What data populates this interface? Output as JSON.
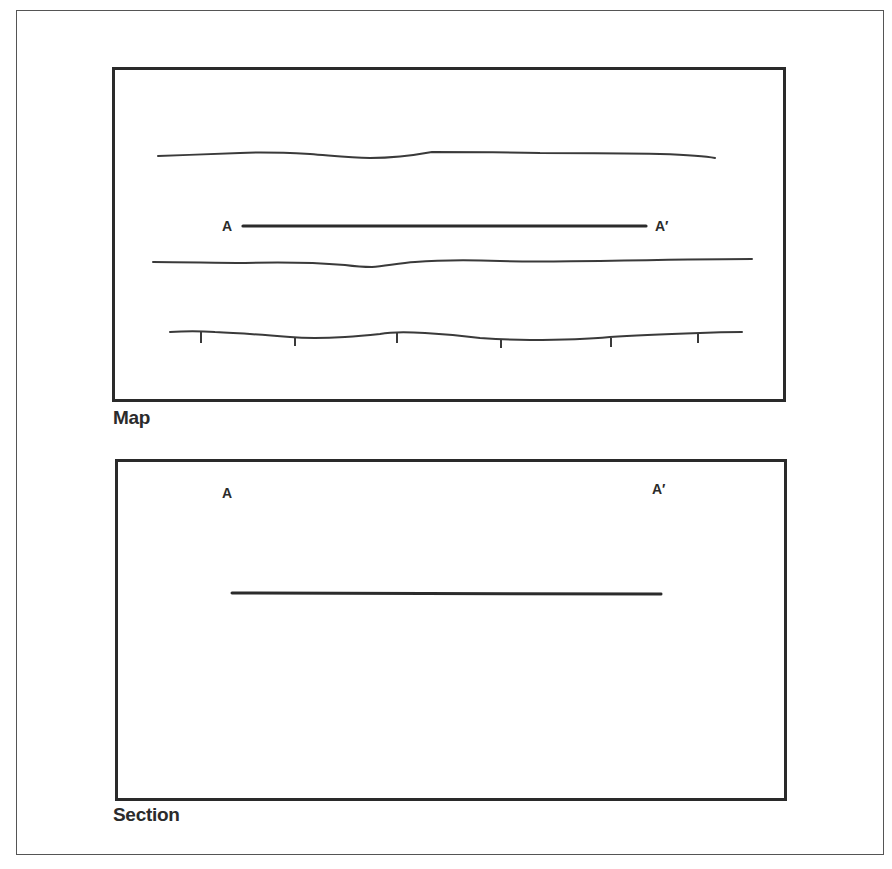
{
  "figure": {
    "panels": [
      {
        "id": "map",
        "caption": "Map",
        "line_label_start": "A",
        "line_label_end": "A′"
      },
      {
        "id": "section",
        "caption": "Section",
        "line_label_start": "A",
        "line_label_end": "A′"
      }
    ],
    "map_features": {
      "contour_lines": 3,
      "tick_marks_on_bottom_line": 6
    },
    "colors": {
      "ink": "#2b2b2b",
      "background": "#ffffff"
    }
  }
}
